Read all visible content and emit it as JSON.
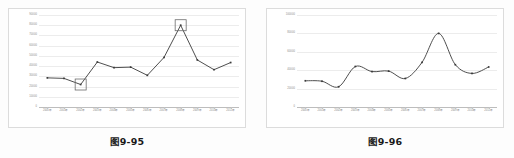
{
  "page": {
    "background_color": "#fdfdfd",
    "frame_border_color": "#dcdcdc",
    "gridline_color": "#ececec",
    "series_color": "#3a3a3a",
    "highlight_box_color": "#6b6b6b",
    "tick_text_color": "#8a8a8a"
  },
  "figures": [
    {
      "id": "figure-left",
      "caption": "图9-95",
      "chart_data": {
        "type": "line",
        "title": "",
        "subtitle": "",
        "xlabel": "",
        "ylabel": "",
        "smoothed": false,
        "markers": true,
        "grid": true,
        "legend": "none",
        "categories": [
          "2000年",
          "2001年",
          "2002年",
          "2003年",
          "2004年",
          "2005年",
          "2006年",
          "2007年",
          "2008年",
          "2009年",
          "2010年",
          "2011年"
        ],
        "values": [
          28500,
          28000,
          22000,
          44000,
          38500,
          39000,
          31000,
          48500,
          80000,
          46000,
          36500,
          43500
        ],
        "ylim": [
          0,
          90000
        ],
        "yticks": [
          0,
          10000,
          20000,
          30000,
          40000,
          50000,
          60000,
          70000,
          80000,
          90000
        ],
        "ytick_labels": [
          "0",
          "10000",
          "20000",
          "30000",
          "40000",
          "50000",
          "60000",
          "70000",
          "80000",
          "90000"
        ],
        "annotations": [
          {
            "label": "highlight-minimum",
            "category": "2002年",
            "value": 22000
          },
          {
            "label": "highlight-maximum",
            "category": "2008年",
            "value": 80000
          }
        ]
      }
    },
    {
      "id": "figure-right",
      "caption": "图9-96",
      "chart_data": {
        "type": "line",
        "title": "",
        "subtitle": "",
        "xlabel": "",
        "ylabel": "",
        "smoothed": true,
        "markers": true,
        "grid": true,
        "legend": "none",
        "categories": [
          "2000年",
          "2001年",
          "2002年",
          "2003年",
          "2004年",
          "2005年",
          "2006年",
          "2007年",
          "2008年",
          "2009年",
          "2010年",
          "2011年"
        ],
        "values": [
          28500,
          28000,
          22000,
          44000,
          38500,
          39000,
          31000,
          48500,
          80000,
          46000,
          36500,
          43500
        ],
        "ylim": [
          0,
          100000
        ],
        "yticks": [
          0,
          20000,
          40000,
          60000,
          80000,
          100000
        ],
        "ytick_labels": [
          "0",
          "20000",
          "40000",
          "60000",
          "80000",
          "100000"
        ],
        "annotations": []
      }
    }
  ]
}
